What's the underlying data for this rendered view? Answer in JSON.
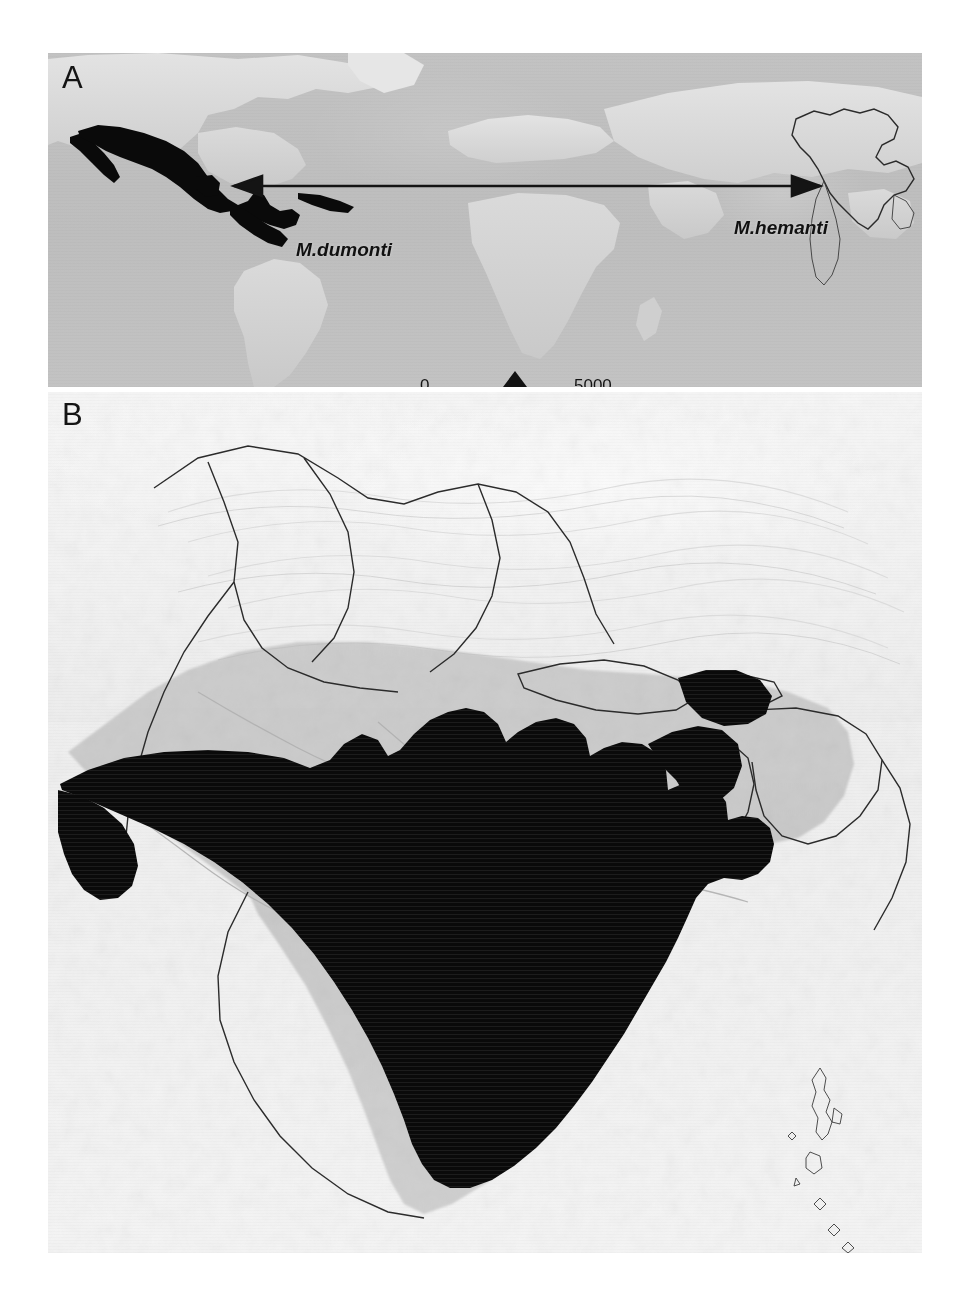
{
  "figure": {
    "type": "two-panel-distribution-map",
    "background_color": "#ffffff",
    "style": "grayscale shaded-relief maps with solid black species distribution fill"
  },
  "panels": [
    {
      "id": "A",
      "label": "A",
      "description": "World map showing disjunct distribution of two species",
      "extent": "global (Americas to South Asia)",
      "distribution_fill_color": "#0a0a0a",
      "features": [
        {
          "name": "M.dumonti range",
          "region": "Mexico, Central America and Cuba",
          "fill": "solid black"
        },
        {
          "name": "M.hemanti range",
          "region": "India",
          "fill": "outline"
        }
      ]
    },
    {
      "id": "B",
      "label": "B",
      "description": "Detailed shaded-relief map of the Indian subcontinent showing distribution of M. hemanti",
      "extent": "Indian subcontinent",
      "distribution_fill_color": "#0a0a0a",
      "features": [
        {
          "name": "distribution area",
          "region": "central and peninsular India, West Bengal, Sikkim region"
        },
        {
          "name": "Himalaya",
          "region": "northern mountain relief"
        },
        {
          "name": "Andaman and Nicobar Islands",
          "region": "Bay of Bengal island chain"
        }
      ]
    }
  ],
  "labels": {
    "species_left": "M.dumonti",
    "species_right": "M.hemanti"
  },
  "arrow": {
    "name": "double-headed-connector",
    "direction": "bidirectional",
    "color": "#141414",
    "left_target": "Mexico / Central America",
    "right_target": "India"
  },
  "scalebar": {
    "min": "0",
    "max": "5000",
    "unit": "Km",
    "north_arrow": true
  },
  "colors": {
    "land": "#c6c6c6",
    "ocean": "#bdbdbd",
    "highland": "#f4f4f4",
    "distribution": "#0a0a0a",
    "boundary": "#2b2b2b",
    "text": "#141414"
  }
}
